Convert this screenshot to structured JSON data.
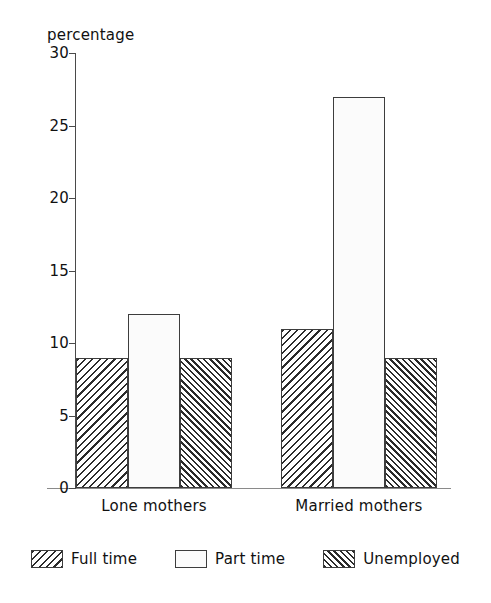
{
  "chart_data": {
    "type": "bar",
    "title": "",
    "subtitle": "",
    "xlabel": "",
    "ylabel": "percentage",
    "ylim": [
      0,
      30
    ],
    "ytick_values": [
      30,
      25,
      20,
      15,
      10,
      5,
      0
    ],
    "ytick_labels": [
      "30",
      "25",
      "20",
      "15",
      "10",
      "5",
      "0"
    ],
    "grid": false,
    "legend_position": "bottom-center",
    "categories": [
      "Lone mothers",
      "Married mothers"
    ],
    "series": [
      {
        "name": "Full time",
        "pattern": "diagonal-backslash-hatch",
        "values": [
          9,
          11
        ]
      },
      {
        "name": "Part time",
        "pattern": "dotted-stipple",
        "values": [
          12,
          27
        ]
      },
      {
        "name": "Unemployed",
        "pattern": "diagonal-forwardslash-hatch",
        "values": [
          9,
          9
        ]
      }
    ]
  },
  "legend": {
    "items": [
      {
        "label": "Full time"
      },
      {
        "label": "Part time"
      },
      {
        "label": "Unemployed"
      }
    ]
  },
  "colors": {
    "axis": "#4a4a4a",
    "bar_outline": "#3d3d3d",
    "hatch": "#2b2b2b",
    "background": "#ffffff"
  }
}
